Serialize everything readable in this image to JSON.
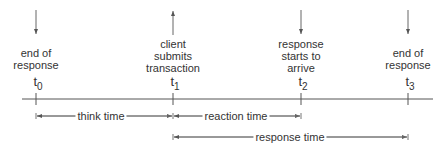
{
  "diagram": {
    "type": "timeline",
    "events": [
      {
        "id": "t0",
        "symbol": "t",
        "subscript": "0",
        "label_lines": [
          "end of",
          "response"
        ],
        "arrow": "down",
        "x": 36
      },
      {
        "id": "t1",
        "symbol": "t",
        "subscript": "1",
        "label_lines": [
          "client",
          "submits",
          "transaction"
        ],
        "arrow": "up",
        "x": 173
      },
      {
        "id": "t2",
        "symbol": "t",
        "subscript": "2",
        "label_lines": [
          "response",
          "starts to",
          "arrive"
        ],
        "arrow": "down",
        "x": 301
      },
      {
        "id": "t3",
        "symbol": "t",
        "subscript": "3",
        "label_lines": [
          "end of",
          "response"
        ],
        "arrow": "down",
        "x": 408
      }
    ],
    "intervals": [
      {
        "label": "think time",
        "from": "t0",
        "to": "t1"
      },
      {
        "label": "reaction time",
        "from": "t1",
        "to": "t2"
      },
      {
        "label": "response time",
        "from": "t1",
        "to": "t3"
      }
    ],
    "colors": {
      "line": "#555555",
      "text": "#333333"
    }
  }
}
